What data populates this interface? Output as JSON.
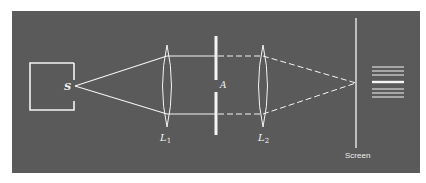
{
  "diagram": {
    "title": "",
    "colors": {
      "panel": "#5a5a5a",
      "lines": "#f4f4f4",
      "page": "#ffffff"
    },
    "labels": {
      "source": "S",
      "lens1": "L",
      "lens1_sub": "1",
      "aperture": "A",
      "lens2": "L",
      "lens2_sub": "2",
      "screen": "Screen"
    },
    "elements": [
      {
        "id": "source-box",
        "type": "box"
      },
      {
        "id": "source-point",
        "label": "S"
      },
      {
        "id": "lens-1",
        "label": "L1"
      },
      {
        "id": "aperture",
        "label": "A",
        "type": "double slit"
      },
      {
        "id": "lens-2",
        "label": "L2"
      },
      {
        "id": "screen",
        "label": "Screen"
      },
      {
        "id": "fringe-pattern",
        "fringe_count": 7
      }
    ]
  }
}
